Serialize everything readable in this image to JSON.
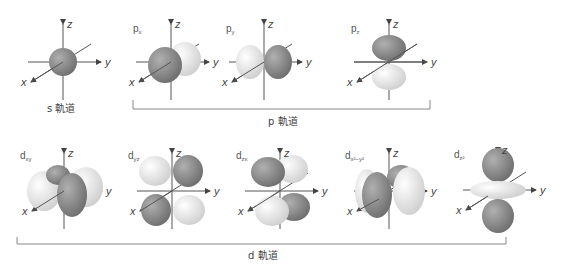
{
  "colors": {
    "dark_lobe": "#8a8a8a",
    "light_lobe": "#e6e6e6",
    "axis": "#555555",
    "bracket": "#888888"
  },
  "axes": {
    "x": "x",
    "y": "y",
    "z": "z"
  },
  "orbitals": [
    {
      "id": "s",
      "label": "",
      "sub": "",
      "caption": "s 軌道"
    },
    {
      "id": "px",
      "label": "p",
      "sub": "x"
    },
    {
      "id": "py",
      "label": "p",
      "sub": "y"
    },
    {
      "id": "pz",
      "label": "p",
      "sub": "z"
    },
    {
      "id": "dxy",
      "label": "d",
      "sub": "xy"
    },
    {
      "id": "dyz",
      "label": "d",
      "sub": "yz"
    },
    {
      "id": "dzx",
      "label": "d",
      "sub": "zx"
    },
    {
      "id": "dx2y2",
      "label": "d",
      "sub": "x²−y²"
    },
    {
      "id": "dz2",
      "label": "d",
      "sub": "z²"
    }
  ],
  "groups": {
    "s": "s 軌道",
    "p": "p 軌道",
    "d": "d 軌道"
  }
}
